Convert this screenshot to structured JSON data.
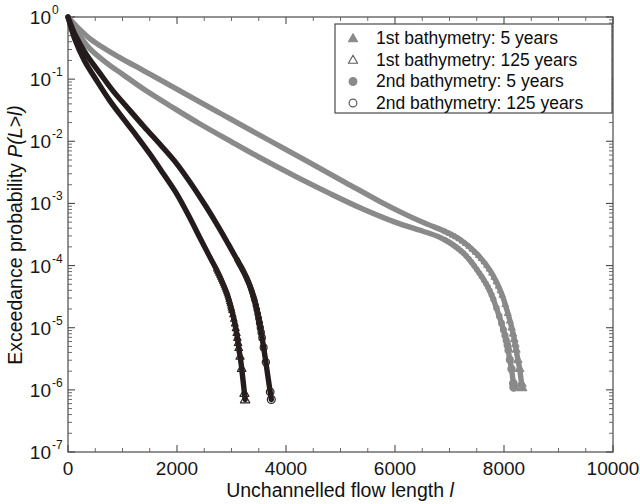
{
  "figure": {
    "axis": {
      "xlabel_text": "Unchannelled flow length ",
      "xlabel_symbol": "l",
      "ylabel_text": "Exceedance probability ",
      "ylabel_symbol": "P(L>l)",
      "x_ticks": [
        "0",
        "2000",
        "4000",
        "6000",
        "8000",
        "10000"
      ],
      "y_ticks": [
        "0",
        "-1",
        "-2",
        "-3",
        "-4",
        "-5",
        "-6",
        "-7"
      ],
      "y_tick_base": "10"
    },
    "legend": {
      "entries": [
        {
          "label": "1st bathymetry: 5 years",
          "marker": "filled-triangle-icon",
          "color": "#8a8a8a"
        },
        {
          "label": "1st bathymetry: 125 years",
          "marker": "open-triangle-icon",
          "color": "#5d5d5d"
        },
        {
          "label": "2nd bathymetry: 5 years",
          "marker": "filled-circle-icon",
          "color": "#8a8a8a"
        },
        {
          "label": "2nd bathymetry: 125 years",
          "marker": "open-circle-icon",
          "color": "#5d5d5d"
        }
      ]
    }
  },
  "chart_data": {
    "type": "line",
    "title": "",
    "xlabel": "Unchannelled flow length l",
    "ylabel": "Exceedance probability P(L>l)",
    "xlim": [
      0,
      10000
    ],
    "ylim": [
      1e-07,
      1
    ],
    "yscale": "log",
    "xscale": "linear",
    "grid": false,
    "legend_position": "top-right",
    "xticks": [
      0,
      2000,
      4000,
      6000,
      8000,
      10000
    ],
    "yticks": [
      1,
      0.1,
      0.01,
      0.001,
      0.0001,
      1e-05,
      1e-06,
      1e-07
    ],
    "series": [
      {
        "name": "1st bathymetry: 5 years",
        "marker": "filled-triangle",
        "color": "#8a8a8a",
        "x": [
          0,
          150,
          400,
          700,
          1000,
          1400,
          1800,
          2300,
          2800,
          3300,
          3900,
          4500,
          5100,
          5700,
          6200,
          6600,
          6900,
          7200,
          7500,
          7750,
          7950,
          8080,
          8160,
          8210,
          8250,
          8290,
          8330
        ],
        "y": [
          1.0,
          0.72,
          0.45,
          0.3,
          0.21,
          0.135,
          0.086,
          0.049,
          0.028,
          0.016,
          0.0082,
          0.0042,
          0.00215,
          0.0011,
          0.00066,
          0.00046,
          0.00036,
          0.00026,
          0.000155,
          8.2e-05,
          3.65e-05,
          1.6e-05,
          8.5e-06,
          5.2e-06,
          3.2e-06,
          2.1e-06,
          1.1e-06
        ]
      },
      {
        "name": "1st bathymetry: 125 years",
        "marker": "open-triangle",
        "color": "#2a2020",
        "x": [
          0,
          120,
          300,
          520,
          760,
          1000,
          1250,
          1500,
          1750,
          2000,
          2220,
          2420,
          2580,
          2720,
          2830,
          2920,
          2990,
          3050,
          3100,
          3140,
          3180,
          3250
        ],
        "y": [
          1.0,
          0.45,
          0.2,
          0.097,
          0.046,
          0.024,
          0.0125,
          0.0063,
          0.003,
          0.0014,
          0.00062,
          0.00028,
          0.00015,
          8.8e-05,
          5.5e-05,
          3.5e-05,
          2.15e-05,
          1.3e-05,
          7.6e-06,
          4.3e-06,
          2.5e-06,
          7e-07
        ]
      },
      {
        "name": "2nd bathymetry: 5 years",
        "marker": "filled-circle",
        "color": "#8a8a8a",
        "x": [
          0,
          150,
          400,
          700,
          1000,
          1400,
          1900,
          2400,
          3000,
          3600,
          4200,
          4800,
          5400,
          6000,
          6500,
          6800,
          7050,
          7300,
          7550,
          7750,
          7900,
          8000,
          8060,
          8100,
          8140,
          8180
        ],
        "y": [
          1.0,
          0.6,
          0.31,
          0.185,
          0.12,
          0.068,
          0.036,
          0.0195,
          0.0098,
          0.005,
          0.00265,
          0.00145,
          0.00082,
          0.0005,
          0.00036,
          0.00029,
          0.00022,
          0.000145,
          7.5e-05,
          3.75e-05,
          1.65e-05,
          8.6e-06,
          5.3e-06,
          3.3e-06,
          2.1e-06,
          1.1e-06
        ]
      },
      {
        "name": "2nd bathymetry: 125 years",
        "marker": "open-circle",
        "color": "#2a2020",
        "x": [
          0,
          130,
          330,
          570,
          830,
          1100,
          1400,
          1700,
          2000,
          2280,
          2530,
          2760,
          2950,
          3100,
          3230,
          3330,
          3410,
          3470,
          3520,
          3570,
          3620,
          3730
        ],
        "y": [
          1.0,
          0.52,
          0.255,
          0.13,
          0.064,
          0.034,
          0.017,
          0.0087,
          0.0043,
          0.00195,
          0.0009,
          0.00042,
          0.000215,
          0.000125,
          7.7e-05,
          4.9e-05,
          3e-05,
          1.85e-05,
          1.1e-05,
          6.2e-06,
          3.2e-06,
          7e-07
        ]
      }
    ]
  }
}
